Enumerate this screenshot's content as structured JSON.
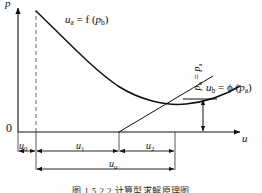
{
  "figure": {
    "caption": "图 1.5  2.2    计算型求解原理图",
    "axes": {
      "y_label_var": "p",
      "x_label_var": "u",
      "origin_label": "0"
    },
    "curves": [
      {
        "name": "demand-curve-a",
        "label_lhs": "u",
        "label_lhs_sub": "a",
        "label_mid": " = f (",
        "label_rhs": "p",
        "label_rhs_sub": "b",
        "label_close": ")",
        "label_text": "ua = f ( pb )"
      },
      {
        "name": "supply-curve-b",
        "label_lhs": "u",
        "label_lhs_sub": "b",
        "label_mid": " = ϕ (",
        "label_rhs": "p",
        "label_rhs_sub": "a",
        "label_close": ")",
        "label_text": "ub = ϕ ( pa )"
      }
    ],
    "annotations": {
      "pressure_equality": {
        "lhs": "p",
        "lhs_sub": "b",
        "eq": " = ",
        "rhs": "p",
        "rhs_sub": "a",
        "text": "pb = pa"
      }
    },
    "dimensions": [
      {
        "id": "u0",
        "var": "u",
        "sub": "0",
        "text": "u0"
      },
      {
        "id": "u1",
        "var": "u",
        "sub": "1",
        "text": "u1"
      },
      {
        "id": "u2",
        "var": "u",
        "sub": "2",
        "text": "u2"
      },
      {
        "id": "ua",
        "var": "u",
        "sub": "a",
        "text": "ua"
      }
    ],
    "colors": {
      "line": "#111111",
      "axis": "#111111",
      "dashed": "#555555",
      "background": "#ffffff"
    }
  }
}
